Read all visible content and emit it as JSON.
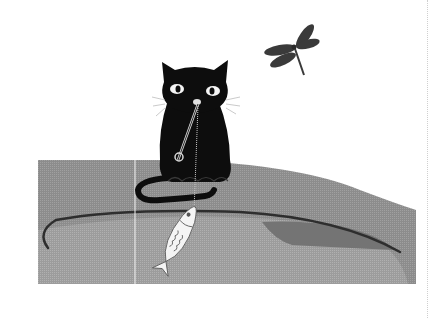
{
  "image": {
    "description": "Illustration of a black cat sitting on the edge of a grey pond, holding a fishing rod with a small white fish hooked on the line; a dragonfly flies in the upper right.",
    "subjects": [
      "black cat",
      "fishing rod",
      "white fish",
      "dragonfly",
      "pond"
    ],
    "colors": {
      "background": "#ffffff",
      "pond": "#8e8e8e",
      "pond_light": "#a2a2a2",
      "pond_dark": "#6e6e6e",
      "cat": "#0d0d0d",
      "dragonfly": "#3a3a3a",
      "fish": "#f4f4f4",
      "rod": "#2a2a2a"
    }
  }
}
